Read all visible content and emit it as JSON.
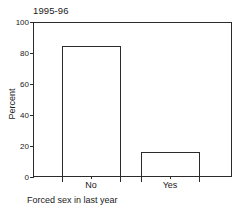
{
  "chart_data": {
    "type": "bar",
    "title": "1995-96",
    "xlabel": "Forced sex in last year",
    "ylabel": "Percent",
    "categories": [
      "No",
      "Yes"
    ],
    "values": [
      84.5,
      16.1
    ],
    "ylim": [
      0,
      100
    ],
    "yticks": [
      0,
      20,
      40,
      60,
      80,
      100
    ],
    "ytick_labels": [
      "0",
      "20",
      "40",
      "60",
      "80",
      "100"
    ],
    "grid": false,
    "legend": "none",
    "bar_style": {
      "fill": "#ffffff",
      "edge": "#2b2b2b"
    }
  },
  "axes": {
    "frame_color": "#2b2b2b",
    "background": "#ffffff"
  }
}
